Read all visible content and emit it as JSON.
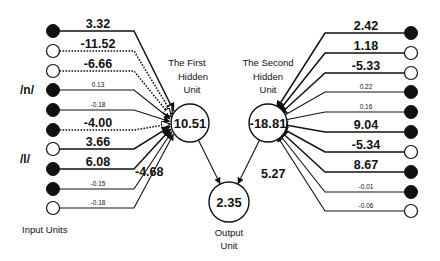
{
  "diagram": {
    "title_hidden1": [
      "The First",
      "Hidden",
      "Unit"
    ],
    "title_hidden2": [
      "The Second",
      "Hidden",
      "Unit"
    ],
    "title_output": [
      "Output",
      "Unit"
    ],
    "input_units_label": "Input Units",
    "phoneme_labels": [
      {
        "text": "/n/",
        "x": 20,
        "y": 94
      },
      {
        "text": "/l/",
        "x": 20,
        "y": 163
      }
    ],
    "hidden1": {
      "value": "10.51",
      "cx": 190,
      "cy": 123,
      "r": 19
    },
    "hidden2": {
      "value": "-18.81",
      "cx": 268,
      "cy": 123,
      "r": 19
    },
    "output": {
      "value": "2.35",
      "cx": 229,
      "cy": 202,
      "r": 20
    },
    "hidden_to_output": [
      {
        "from": "hidden1",
        "weight": "-4.68",
        "label_x": 135,
        "label_y": 176
      },
      {
        "from": "hidden2",
        "weight": "5.27",
        "label_x": 261,
        "label_y": 178
      }
    ],
    "left_inputs": [
      {
        "y": 31,
        "filled": true,
        "weight": "3.32",
        "size": "big",
        "dotted": false
      },
      {
        "y": 51,
        "filled": false,
        "weight": "-11.52",
        "size": "big",
        "dotted": true
      },
      {
        "y": 71,
        "filled": false,
        "weight": "-6.66",
        "size": "big",
        "dotted": true
      },
      {
        "y": 90,
        "filled": true,
        "weight": "0.13",
        "size": "small",
        "dotted": false
      },
      {
        "y": 110,
        "filled": true,
        "weight": "-0.18",
        "size": "small",
        "dotted": false
      },
      {
        "y": 130,
        "filled": true,
        "weight": "-4.00",
        "size": "big",
        "dotted": true
      },
      {
        "y": 149,
        "filled": false,
        "weight": "3.66",
        "size": "big",
        "dotted": false
      },
      {
        "y": 169,
        "filled": true,
        "weight": "6.08",
        "size": "big",
        "dotted": false
      },
      {
        "y": 189,
        "filled": true,
        "weight": "-0.15",
        "size": "small",
        "dotted": false
      },
      {
        "y": 208,
        "filled": false,
        "weight": "-0.18",
        "size": "small",
        "dotted": false
      }
    ],
    "right_inputs": [
      {
        "y": 33,
        "filled": true,
        "weight": "2.42",
        "size": "big"
      },
      {
        "y": 53,
        "filled": false,
        "weight": "1.18",
        "size": "big"
      },
      {
        "y": 73,
        "filled": false,
        "weight": "-5.33",
        "size": "big"
      },
      {
        "y": 92,
        "filled": true,
        "weight": "0.22",
        "size": "small"
      },
      {
        "y": 112,
        "filled": true,
        "weight": "0.16",
        "size": "small"
      },
      {
        "y": 132,
        "filled": true,
        "weight": "9.04",
        "size": "big"
      },
      {
        "y": 152,
        "filled": false,
        "weight": "-5.34",
        "size": "big"
      },
      {
        "y": 172,
        "filled": true,
        "weight": "8.67",
        "size": "big"
      },
      {
        "y": 192,
        "filled": true,
        "weight": "-0.01",
        "size": "small"
      },
      {
        "y": 211,
        "filled": false,
        "weight": "-0.06",
        "size": "small"
      }
    ],
    "colors": {
      "ink": "#111111",
      "background": "#ffffff"
    }
  }
}
